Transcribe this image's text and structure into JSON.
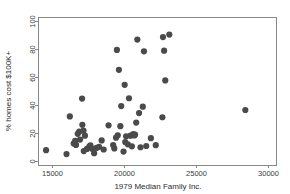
{
  "chart_data": {
    "type": "scatter",
    "title": "",
    "xlabel": "1979 Median Family Inc.",
    "ylabel": "% homes cost $100K+",
    "xlim": [
      14000,
      30600
    ],
    "ylim": [
      -3,
      103
    ],
    "xticks": [
      15000,
      20000,
      25000,
      30000
    ],
    "xtick_labels": [
      "15000",
      "20000",
      "25000",
      "30000"
    ],
    "yticks": [
      0,
      20,
      40,
      60,
      80,
      100
    ],
    "ytick_labels": [
      "0",
      "20",
      "40",
      "60",
      "80",
      "100"
    ],
    "grid": false,
    "legend": "none",
    "marker": "filled-circle",
    "marker_color": "#4a4a4a",
    "marker_size": 3.1,
    "point_count": 58,
    "points": [
      {
        "x": 14560,
        "y": 7.6
      },
      {
        "x": 15980,
        "y": 4.8
      },
      {
        "x": 16210,
        "y": 31.8
      },
      {
        "x": 16480,
        "y": 12.4
      },
      {
        "x": 16580,
        "y": 14.3
      },
      {
        "x": 16640,
        "y": 11.4
      },
      {
        "x": 16760,
        "y": 19.3
      },
      {
        "x": 16860,
        "y": 20.9
      },
      {
        "x": 16920,
        "y": 15.2
      },
      {
        "x": 17060,
        "y": 44.6
      },
      {
        "x": 17080,
        "y": 25.8
      },
      {
        "x": 17160,
        "y": 21.6
      },
      {
        "x": 17180,
        "y": 7.0
      },
      {
        "x": 17260,
        "y": 18.0
      },
      {
        "x": 17400,
        "y": 8.5
      },
      {
        "x": 17560,
        "y": 10.2
      },
      {
        "x": 17640,
        "y": 11.0
      },
      {
        "x": 17760,
        "y": 8.6
      },
      {
        "x": 17900,
        "y": 5.4
      },
      {
        "x": 18060,
        "y": 9.2
      },
      {
        "x": 18240,
        "y": 10.0
      },
      {
        "x": 18420,
        "y": 14.6
      },
      {
        "x": 18560,
        "y": 8.1
      },
      {
        "x": 18900,
        "y": 25.4
      },
      {
        "x": 19220,
        "y": 11.3
      },
      {
        "x": 19300,
        "y": 8.9
      },
      {
        "x": 19420,
        "y": 16.6
      },
      {
        "x": 19480,
        "y": 79.4
      },
      {
        "x": 19540,
        "y": 18.3
      },
      {
        "x": 19620,
        "y": 65.2
      },
      {
        "x": 19720,
        "y": 24.8
      },
      {
        "x": 19780,
        "y": 39.2
      },
      {
        "x": 19940,
        "y": 6.6
      },
      {
        "x": 20020,
        "y": 54.4
      },
      {
        "x": 20060,
        "y": 13.4
      },
      {
        "x": 20120,
        "y": 17.6
      },
      {
        "x": 20240,
        "y": 11.8
      },
      {
        "x": 20320,
        "y": 44.8
      },
      {
        "x": 20420,
        "y": 18.0
      },
      {
        "x": 20520,
        "y": 10.4
      },
      {
        "x": 20620,
        "y": 19.2
      },
      {
        "x": 20680,
        "y": 18.2
      },
      {
        "x": 20740,
        "y": 18.7
      },
      {
        "x": 20820,
        "y": 27.4
      },
      {
        "x": 20900,
        "y": 86.8
      },
      {
        "x": 21020,
        "y": 34.2
      },
      {
        "x": 21120,
        "y": 9.7
      },
      {
        "x": 21280,
        "y": 38.8
      },
      {
        "x": 21360,
        "y": 78.4
      },
      {
        "x": 21520,
        "y": 10.6
      },
      {
        "x": 21840,
        "y": 16.2
      },
      {
        "x": 22180,
        "y": 11.2
      },
      {
        "x": 22640,
        "y": 31.2
      },
      {
        "x": 22680,
        "y": 88.6
      },
      {
        "x": 22760,
        "y": 78.9
      },
      {
        "x": 22840,
        "y": 57.6
      },
      {
        "x": 23120,
        "y": 90.4
      },
      {
        "x": 28400,
        "y": 36.4
      }
    ]
  },
  "colors": {
    "axis": "#888888",
    "text": "#2b2b2b",
    "marker": "#4a4a4a",
    "background": "#ffffff"
  }
}
